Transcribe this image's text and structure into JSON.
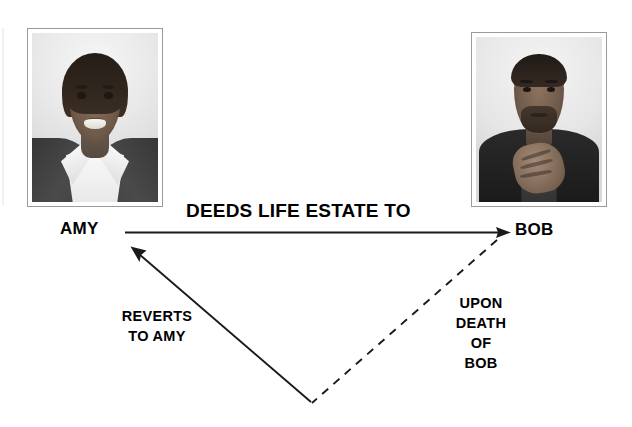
{
  "diagram": {
    "nodes": [
      {
        "id": "amy",
        "label": "AMY",
        "photo": "portrait-photo-amy"
      },
      {
        "id": "bob",
        "label": "BOB",
        "photo": "portrait-photo-bob"
      }
    ],
    "edges": [
      {
        "id": "deeds",
        "from": "amy",
        "to": "bob",
        "label": "DEEDS LIFE ESTATE TO",
        "style": "solid",
        "direction": "right"
      },
      {
        "id": "upon-death",
        "from": "bob",
        "to": "vertex",
        "label_line1": "UPON",
        "label_line2": "DEATH",
        "label_line3": "OF BOB",
        "style": "dashed",
        "direction": "down-left"
      },
      {
        "id": "reverts",
        "from": "vertex",
        "to": "amy",
        "label_line1": "REVERTS",
        "label_line2": "TO AMY",
        "style": "solid",
        "direction": "up-left"
      }
    ]
  },
  "colors": {
    "ink": "#1a1a1a",
    "frame_border": "#9a9a9a",
    "background": "#ffffff"
  }
}
